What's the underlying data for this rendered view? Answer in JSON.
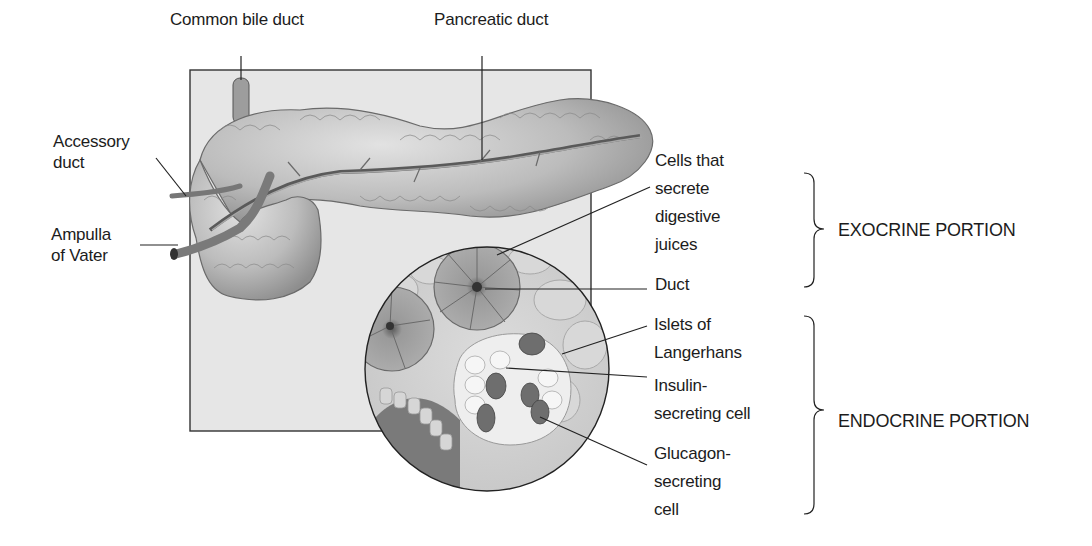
{
  "diagram": {
    "labels": {
      "common_bile_duct": "Common bile duct",
      "pancreatic_duct": "Pancreatic duct",
      "accessory_duct": "Accessory\nduct",
      "ampulla_of_vater": "Ampulla\nof Vater",
      "cells_secrete_juices": "Cells that\nsecrete\ndigestive\njuices",
      "duct": "Duct",
      "islets_of_langerhans": "Islets of\nLangerhans",
      "insulin_cell": "Insulin-\nsecreting cell",
      "glucagon_cell": "Glucagon-\nsecreting\ncell"
    },
    "portions": {
      "exocrine": "EXOCRINE PORTION",
      "endocrine": "ENDOCRINE PORTION"
    },
    "colors": {
      "panel": "#e6e6e6",
      "organ": "#bdbdbd",
      "organ_dark": "#8a8a8a",
      "acinus": "#9a9a9a",
      "islet_light": "#eeeeee",
      "islet_dark": "#6e6e6e",
      "line": "#222222"
    }
  }
}
